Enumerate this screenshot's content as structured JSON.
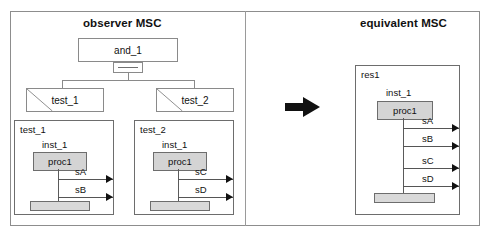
{
  "figure": {
    "panels": [
      {
        "id": "observer",
        "title": "observer MSC"
      },
      {
        "id": "equivalent",
        "title": "equivalent MSC"
      }
    ],
    "transform_arrow": "right-arrow"
  },
  "observer": {
    "root_node": {
      "label": "and_1",
      "operator_symbol": "and-bar"
    },
    "references": [
      {
        "label": "test_1"
      },
      {
        "label": "test_2"
      }
    ],
    "msc_diagrams": [
      {
        "name": "test_1",
        "instance_name": "inst_1",
        "instance_head": "proc1",
        "messages": [
          {
            "label": "sA"
          },
          {
            "label": "sB"
          }
        ]
      },
      {
        "name": "test_2",
        "instance_name": "inst_1",
        "instance_head": "proc1",
        "messages": [
          {
            "label": "sC"
          },
          {
            "label": "sD"
          }
        ]
      }
    ]
  },
  "equivalent": {
    "msc_diagram": {
      "name": "res1",
      "instance_name": "inst_1",
      "instance_head": "proc1",
      "messages": [
        {
          "label": "sA"
        },
        {
          "label": "sB"
        },
        {
          "label": "sC"
        },
        {
          "label": "sD"
        }
      ]
    }
  },
  "colors": {
    "frame_border": "#8d8d8d",
    "box_border": "#6d6d6d",
    "instance_head_fill": "#d4d4d4",
    "end_bar_fill": "#d9d9d9",
    "arrow": "#111111",
    "background": "#ffffff"
  }
}
